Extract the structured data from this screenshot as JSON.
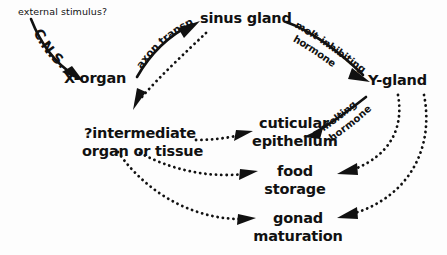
{
  "diagram": {
    "background_color": "#fdfdfd",
    "ink_color": "#111111",
    "nodes": {
      "external_stimulus": "external stimulus?",
      "x_organ": "X-organ",
      "sinus_gland": "sinus gland",
      "y_gland": "Y-gland",
      "intermediate_line1": "?intermediate",
      "intermediate_line2": "organ or tissue",
      "cuticular_line1": "cuticular",
      "cuticular_line2": "epithelium",
      "food_line1": "food",
      "food_line2": "storage",
      "gonad_line1": "gonad",
      "gonad_line2": "maturation"
    },
    "edge_labels": {
      "cns": "C.N.S.",
      "axon_transport": "axon transport",
      "molt_inhibiting_line1": "molt-inhibiting",
      "molt_inhibiting_line2": "hormone",
      "molting_line1": "molting",
      "molting_line2": "hormone"
    },
    "edges": [
      {
        "from": "external stimulus?",
        "to": "X-organ",
        "label": "C.N.S.",
        "style": "solid"
      },
      {
        "from": "X-organ",
        "to": "sinus gland",
        "label": "axon transport",
        "style": "solid"
      },
      {
        "from": "sinus gland",
        "to": "Y-gland",
        "label": "molt-inhibiting hormone",
        "style": "solid"
      },
      {
        "from": "sinus gland",
        "to": "?intermediate organ or tissue",
        "label": "",
        "style": "dotted"
      },
      {
        "from": "Y-gland",
        "to": "cuticular epithelium",
        "label": "molting hormone",
        "style": "solid"
      },
      {
        "from": "Y-gland",
        "to": "food storage",
        "label": "",
        "style": "dotted"
      },
      {
        "from": "Y-gland",
        "to": "gonad maturation",
        "label": "",
        "style": "dotted"
      },
      {
        "from": "?intermediate organ or tissue",
        "to": "cuticular epithelium",
        "label": "",
        "style": "dotted"
      },
      {
        "from": "?intermediate organ or tissue",
        "to": "food storage",
        "label": "",
        "style": "dotted"
      },
      {
        "from": "?intermediate organ or tissue",
        "to": "gonad maturation",
        "label": "",
        "style": "dotted"
      }
    ]
  }
}
